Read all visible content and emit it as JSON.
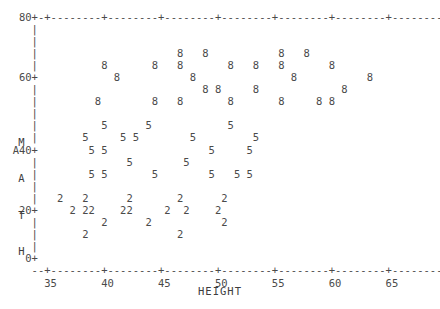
{
  "plot": {
    "type": "character-scatter",
    "xlabel": "HEIGHT",
    "ylabel": "MATH",
    "ylabel_chars": [
      "M",
      "A",
      "T",
      "H"
    ],
    "plot_symbols": [
      "2",
      "5",
      "8"
    ],
    "x_tick_labels": [
      "35",
      "40",
      "45",
      "50",
      "55",
      "60",
      "65",
      "70"
    ],
    "y_tick_labels": [
      "80",
      "60",
      "40",
      "20",
      "0"
    ],
    "xlim": [
      33,
      71
    ],
    "ylim": [
      0,
      80
    ],
    "grid": false,
    "legend": "none",
    "axis_style": "ascii-dashes-plus",
    "text_color": "#4a4a4a"
  },
  "chart_data": {
    "type": "scatter",
    "title": "",
    "subtitle": "",
    "xlabel": "HEIGHT",
    "ylabel": "MATH",
    "xlim": [
      33,
      71
    ],
    "ylim": [
      0,
      80
    ],
    "xticks": [
      35,
      40,
      45,
      50,
      55,
      60,
      65,
      70
    ],
    "yticks": [
      0,
      20,
      40,
      60,
      80
    ],
    "grid": false,
    "legend_position": "none",
    "series": [
      {
        "name": "Group 2",
        "marker": "2",
        "points": [
          [
            36.5,
            24
          ],
          [
            39.0,
            24
          ],
          [
            43.5,
            24
          ],
          [
            49.0,
            24
          ],
          [
            51.5,
            24
          ],
          [
            37.5,
            20
          ],
          [
            39.5,
            20
          ],
          [
            40.0,
            20
          ],
          [
            42.5,
            20
          ],
          [
            43.0,
            20
          ],
          [
            45.5,
            20
          ],
          [
            47.0,
            20
          ],
          [
            49.5,
            20
          ],
          [
            41.5,
            17
          ],
          [
            44.5,
            17
          ],
          [
            49.5,
            17
          ],
          [
            38.5,
            13
          ],
          [
            47.5,
            13
          ]
        ]
      },
      {
        "name": "Group 5",
        "marker": "5",
        "points": [
          [
            49.0,
            46
          ],
          [
            51.0,
            46
          ],
          [
            57.5,
            46
          ],
          [
            47.5,
            42
          ],
          [
            50.0,
            42
          ],
          [
            50.5,
            42
          ],
          [
            56.0,
            42
          ],
          [
            58.5,
            42
          ],
          [
            48.5,
            38
          ],
          [
            49.5,
            38
          ],
          [
            54.5,
            38
          ],
          [
            51.0,
            34
          ],
          [
            53.5,
            34
          ],
          [
            48.5,
            30
          ],
          [
            49.5,
            30
          ],
          [
            52.5,
            30
          ],
          [
            55.5,
            30
          ],
          [
            57.5,
            30
          ],
          [
            58.5,
            30
          ]
        ]
      },
      {
        "name": "Group 8",
        "marker": "8",
        "points": [
          [
            55.0,
            73
          ],
          [
            57.0,
            73
          ],
          [
            61.0,
            73
          ],
          [
            63.0,
            73
          ],
          [
            50.5,
            69
          ],
          [
            54.5,
            69
          ],
          [
            55.5,
            69
          ],
          [
            59.0,
            69
          ],
          [
            61.5,
            69
          ],
          [
            63.0,
            69
          ],
          [
            65.0,
            69
          ],
          [
            52.0,
            65
          ],
          [
            57.5,
            65
          ],
          [
            66.5,
            65
          ],
          [
            69.0,
            65
          ],
          [
            56.5,
            61
          ],
          [
            57.0,
            61
          ],
          [
            59.5,
            61
          ],
          [
            65.5,
            61
          ],
          [
            51.5,
            57
          ],
          [
            55.0,
            57
          ],
          [
            56.0,
            57
          ],
          [
            59.0,
            57
          ],
          [
            62.5,
            57
          ],
          [
            65.0,
            57
          ],
          [
            65.5,
            57
          ]
        ]
      }
    ]
  },
  "canvas": {
    "rows": [
      "   80+-+--------+--------+--------+--------+--------+--------+--------+--",
      "     |                                                                 +",
      "     |                                                                 |",
      "     |                      8   8           8   8                      |",
      "     |          8       8   8       8   8   8       8                  |",
      "   60+            8           8               8           8            +",
      "     |                          8 8     8             8                |",
      "     |         8        8   8       8       8     8 8                  |",
      "     |                                                                 |",
      "     |          5      5            5                                  |",
      "  M  |       5     5 5        5         5                              +",
      "  A40+        5 5                5     5                               |",
      "  T  |              5        5                                         |",
      "  H  |        5 5       5        5   5 5                               |",
      "     |                                                                 |",
      "     |   2   2      2       2      2                                   +",
      "   20+     2 22    22     2  2    2                                    |",
      "     |          2      2           2                                   |",
      "     |       2              2                                          |",
      "     |                                                                 +",
      "    0+                                                                 |",
      "     --+--------+--------+--------+--------+--------+--------+--------+--",
      "       35       40       45       50       55       60       65       70"
    ]
  }
}
